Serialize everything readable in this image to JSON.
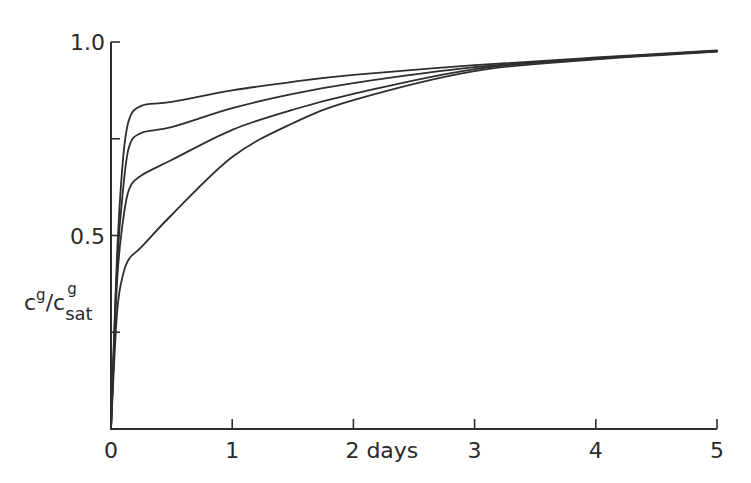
{
  "chart_data": {
    "type": "line",
    "title": "",
    "xlabel": "days",
    "ylabel": "c^g/c^g_sat",
    "ylabel_parts": {
      "num": "c",
      "num_sup": "g",
      "slash": "/",
      "den": "c",
      "den_sup": "g",
      "den_sub": "sat"
    },
    "xlim": [
      0,
      5
    ],
    "ylim": [
      0,
      1.0
    ],
    "grid": false,
    "legend": null,
    "x_ticks": [
      {
        "value": 0,
        "label": "0"
      },
      {
        "value": 1,
        "label": "1"
      },
      {
        "value": 2,
        "label": "2 days"
      },
      {
        "value": 3,
        "label": "3"
      },
      {
        "value": 4,
        "label": "4"
      },
      {
        "value": 5,
        "label": "5"
      }
    ],
    "y_ticks": [
      {
        "value": 0.25,
        "label": ""
      },
      {
        "value": 0.5,
        "label": "0.5"
      },
      {
        "value": 0.75,
        "label": ""
      },
      {
        "value": 1.0,
        "label": "1.0"
      }
    ],
    "x": [
      0,
      0.05,
      0.1,
      0.15,
      0.25,
      0.5,
      1.0,
      1.5,
      2.0,
      3.0,
      4.0,
      5.0
    ],
    "series": [
      {
        "name": "curve-1",
        "values": [
          0.0,
          0.45,
          0.7,
          0.8,
          0.835,
          0.845,
          0.875,
          0.897,
          0.915,
          0.94,
          0.96,
          0.978
        ]
      },
      {
        "name": "curve-2",
        "values": [
          0.0,
          0.42,
          0.62,
          0.73,
          0.765,
          0.78,
          0.829,
          0.866,
          0.894,
          0.935,
          0.958,
          0.977
        ]
      },
      {
        "name": "curve-3",
        "values": [
          0.0,
          0.38,
          0.54,
          0.62,
          0.655,
          0.695,
          0.773,
          0.825,
          0.866,
          0.93,
          0.957,
          0.976
        ]
      },
      {
        "name": "curve-4",
        "values": [
          0.0,
          0.3,
          0.4,
          0.44,
          0.47,
          0.553,
          0.703,
          0.79,
          0.85,
          0.925,
          0.955,
          0.975
        ]
      }
    ]
  }
}
